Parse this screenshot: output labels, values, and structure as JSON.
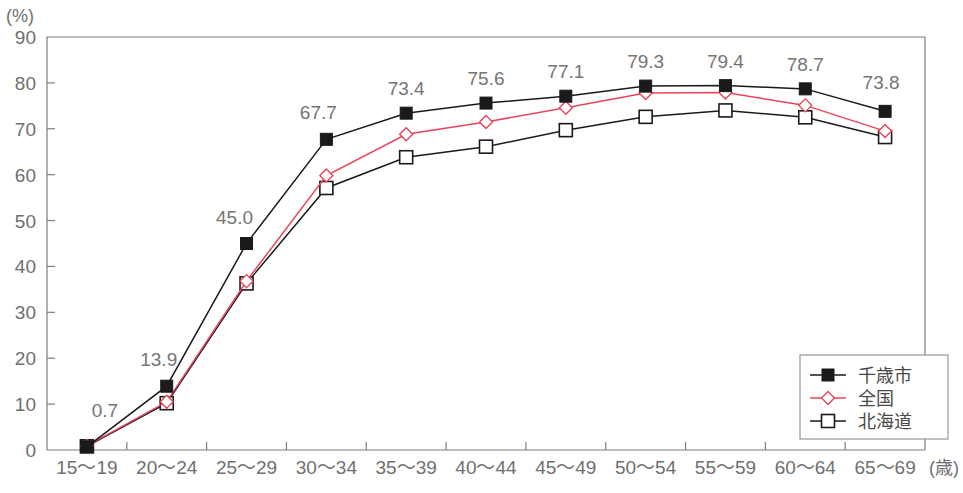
{
  "chart_data": {
    "type": "line",
    "title": "",
    "subtitle": "",
    "xlabel": "",
    "ylabel": "(%)",
    "x_axis_suffix": "(歳)",
    "categories": [
      "15～19",
      "20～24",
      "25～29",
      "30～34",
      "35～39",
      "40～44",
      "45～49",
      "50～54",
      "55～59",
      "60～64",
      "65～69"
    ],
    "ylim": [
      0,
      90
    ],
    "yticks": [
      0,
      10,
      20,
      30,
      40,
      50,
      60,
      70,
      80,
      90
    ],
    "grid": false,
    "legend_position": "bottom-right",
    "series": [
      {
        "name": "千歳市",
        "color": "#1a1a1a",
        "marker": "filled-square",
        "values": [
          0.7,
          13.9,
          45.0,
          67.7,
          73.4,
          75.6,
          77.1,
          79.3,
          79.4,
          78.7,
          73.8
        ],
        "labels": [
          "0.7",
          "13.9",
          "45.0",
          "67.7",
          "73.4",
          "75.6",
          "77.1",
          "79.3",
          "79.4",
          "78.7",
          "73.8"
        ]
      },
      {
        "name": "全国",
        "color": "#e8445a",
        "marker": "open-diamond",
        "values": [
          0.9,
          10.5,
          36.8,
          59.8,
          68.8,
          71.5,
          74.6,
          77.8,
          77.9,
          75.1,
          69.5
        ]
      },
      {
        "name": "北海道",
        "color": "#1a1a1a",
        "marker": "open-square",
        "values": [
          0.8,
          10.2,
          36.3,
          57.1,
          63.8,
          66.1,
          69.7,
          72.6,
          74.0,
          72.5,
          68.2
        ]
      }
    ]
  },
  "legend": {
    "entries": [
      {
        "label": "千歳市"
      },
      {
        "label": "全国"
      },
      {
        "label": "北海道"
      }
    ]
  },
  "axis": {
    "y_unit": "(%)",
    "x_suffix": "(歳)"
  }
}
